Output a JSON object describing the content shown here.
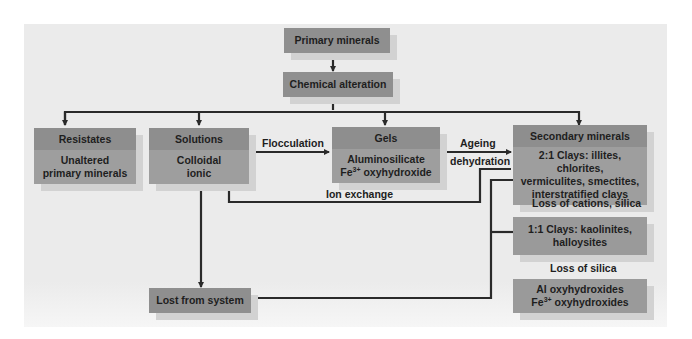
{
  "diagram": {
    "nodes": {
      "primary_minerals": {
        "label": "Primary minerals"
      },
      "chemical_alteration": {
        "label": "Chemical alteration"
      },
      "resistates": {
        "title": "Resistates",
        "body_line1": "Unaltered",
        "body_line2": "primary minerals"
      },
      "solutions": {
        "title": "Solutions",
        "body_line1": "Colloidal",
        "body_line2": "ionic"
      },
      "gels": {
        "title": "Gels",
        "body_line1": "Aluminosilicate",
        "body_line2_prefix": "Fe",
        "body_line2_sup": "3+",
        "body_line2_suffix": " oxyhydroxide"
      },
      "secondary_minerals": {
        "title": "Secondary minerals",
        "body_line1": "2:1 Clays: illites, chlorites,",
        "body_line2": "vermiculites, smectites,",
        "body_line3": "interstratified clays"
      },
      "clays_1_1": {
        "line1": "1:1 Clays: kaolinites,",
        "line2": "halloysites"
      },
      "oxyhydroxides": {
        "line1": "Al oxyhydroxides",
        "line2_prefix": "Fe",
        "line2_sup": "3+",
        "line2_suffix": " oxyhydroxides"
      },
      "lost_from_system": {
        "label": "Lost from system"
      }
    },
    "edge_labels": {
      "flocculation": "Flocculation",
      "ageing": "Ageing",
      "dehydration": "dehydration",
      "ion_exchange": "Ion exchange",
      "loss_cations_silica": "Loss of cations, silica",
      "loss_silica": "Loss of silica"
    },
    "colors": {
      "panel_bg": "#ebebeb",
      "box_header": "#8e8e8e",
      "box_body": "#9e9e9e",
      "box_shadow": "#d2d2d2",
      "line": "#2a2a2a"
    }
  }
}
